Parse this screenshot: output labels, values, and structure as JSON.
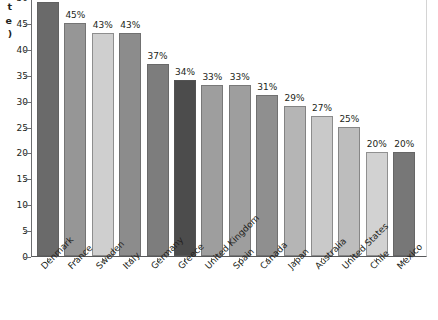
{
  "chart_data": {
    "type": "bar",
    "title": "",
    "subtitle": "",
    "xlabel": "",
    "ylabel": "t\ne\n)",
    "ylabel_note": "y-axis title is clipped at the left edge of the screenshot; only the trailing glyphs of three wrapped lines are visible",
    "ylim": [
      0,
      50
    ],
    "ytick_values": [
      0,
      5,
      10,
      15,
      20,
      25,
      30,
      35,
      40,
      45,
      50
    ],
    "ytick_labels": [
      "0",
      "5",
      "10",
      "15",
      "20",
      "25",
      "30",
      "35",
      "40",
      "45",
      "50"
    ],
    "grid": false,
    "legend": null,
    "value_suffix": "%",
    "categories": [
      "Denmark",
      "France",
      "Sweden",
      "Italy",
      "Germany",
      "Greece",
      "United Kingdom",
      "Spain",
      "Canada",
      "Japan",
      "Australia",
      "United States",
      "Chile",
      "Mexico"
    ],
    "values": [
      49,
      45,
      43,
      43,
      37,
      34,
      33,
      33,
      31,
      29,
      27,
      25,
      20,
      20
    ],
    "value_labels": [
      "49%",
      "45%",
      "43%",
      "43%",
      "37%",
      "34%",
      "33%",
      "33%",
      "31%",
      "29%",
      "27%",
      "25%",
      "20%",
      "20%"
    ],
    "bar_colors": [
      "#6a6a6a",
      "#969696",
      "#cfcfcf",
      "#8c8c8c",
      "#7d7d7d",
      "#4c4c4c",
      "#9e9e9e",
      "#9e9e9e",
      "#8f8f8f",
      "#b5b5b5",
      "#c9c9c9",
      "#bdbdbd",
      "#d2d2d2",
      "#777777"
    ],
    "highlight_category": "Greece",
    "axis_color": "#58595b",
    "text_color": "#231f20",
    "background_color": "#ffffff"
  }
}
